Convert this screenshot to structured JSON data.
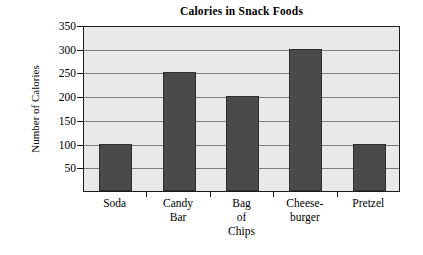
{
  "chart_data": {
    "type": "bar",
    "title": "Calories in Snack Foods",
    "xlabel": "",
    "ylabel": "Number of Calories",
    "categories": [
      "Soda",
      "Candy Bar",
      "Bag of Chips",
      "Cheese-burger",
      "Pretzel"
    ],
    "category_lines": [
      [
        "Soda"
      ],
      [
        "Candy",
        "Bar"
      ],
      [
        "Bag",
        "of",
        "Chips"
      ],
      [
        "Cheese-",
        "burger"
      ],
      [
        "Pretzel"
      ]
    ],
    "values": [
      100,
      250,
      200,
      300,
      100
    ],
    "ylim": [
      0,
      350
    ],
    "ytick_values": [
      50,
      100,
      150,
      200,
      250,
      300,
      350
    ],
    "ytick_labels": [
      "50",
      "100",
      "150",
      "200",
      "250",
      "300",
      "350"
    ],
    "grid": true,
    "legend": false,
    "colors": {
      "bar_fill": "#4a4a4a",
      "bar_edge": "#2e2e2e",
      "plot_background": "#e9e9e7",
      "gridline": "#7d7d7d",
      "axis": "#1b1b1b",
      "text": "#000000",
      "page_background": "#ffffff"
    }
  }
}
